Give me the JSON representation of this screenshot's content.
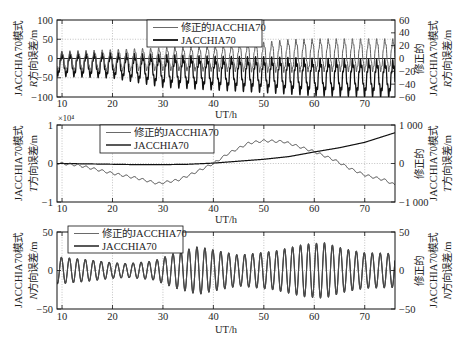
{
  "figure": {
    "panels_count": 3,
    "background": "#ffffff"
  },
  "chart_data": [
    {
      "type": "line",
      "panel": "R",
      "xlabel": "UT/h",
      "xlim": [
        9,
        76
      ],
      "xticks": [
        10,
        20,
        30,
        40,
        50,
        60,
        70
      ],
      "xticklabels": [
        "10",
        "20",
        "30",
        "40",
        "50",
        "60",
        "70"
      ],
      "ylabel_left": {
        "line1": "JACCHIA70模式",
        "var": "R",
        "line2": "方向误差/m"
      },
      "ylabel_right": {
        "line0": "修正的",
        "line1": "JACCHIA70模式",
        "var": "R",
        "line2": "方向误差/m"
      },
      "ylim_left": [
        -100,
        100
      ],
      "yticks_left": [
        -100,
        -50,
        0,
        50,
        100
      ],
      "yticklabels_left": [
        "−100",
        "−50",
        "0",
        "50",
        "100"
      ],
      "ylim_right": [
        -60,
        60
      ],
      "yticks_right": [
        -60,
        -40,
        -20,
        0,
        20,
        40,
        60
      ],
      "yticklabels_right": [
        "−60",
        "−40",
        "−20",
        "0",
        "20",
        "40",
        "60"
      ],
      "grid": true,
      "legend": [
        {
          "label": "修正的JACCHIA70",
          "color": "#6a6a6a",
          "width": 1.0
        },
        {
          "label": "JACCHIA70",
          "color": "#111111",
          "width": 1.8
        }
      ],
      "series": [
        {
          "name": "修正的JACCHIA70",
          "axis": "right",
          "color": "#5e5e5e",
          "width": 1.0,
          "period_h": 1.6,
          "ripple": 0.15,
          "x": [
            9,
            10,
            20,
            30,
            40,
            50,
            55,
            60,
            70,
            76
          ],
          "trend": [
            -4,
            -4,
            -3,
            -1,
            0,
            2,
            4,
            5,
            5,
            5
          ],
          "amplitude": [
            14,
            14,
            15,
            16,
            18,
            21,
            23,
            23,
            23,
            23
          ]
        },
        {
          "name": "JACCHIA70",
          "axis": "left",
          "color": "#111111",
          "width": 1.3,
          "period_h": 1.6,
          "ripple": 0.25,
          "x": [
            9,
            10,
            20,
            30,
            40,
            50,
            60,
            70,
            76
          ],
          "trend": [
            -14,
            -15,
            -18,
            -32,
            -38,
            -42,
            -48,
            -50,
            -52
          ],
          "amplitude": [
            26,
            26,
            27,
            35,
            36,
            38,
            40,
            40,
            40
          ]
        }
      ]
    },
    {
      "type": "line",
      "panel": "T",
      "xlabel": "UT/h",
      "xlim": [
        9,
        76
      ],
      "xticks": [
        10,
        20,
        30,
        40,
        50,
        60,
        70
      ],
      "xticklabels": [
        "10",
        "20",
        "30",
        "40",
        "50",
        "60",
        "70"
      ],
      "y_multiplier": "×10⁴",
      "ylabel_left": {
        "line1": "JACCHIA70模式",
        "var": "T",
        "line2": "方向误差/m"
      },
      "ylabel_right": {
        "line0": "修正的",
        "line1": "JACCHIA70模式",
        "var": "T",
        "line2": "方向误差/m"
      },
      "ylim_left": [
        -1,
        1
      ],
      "yticks_left": [
        -1,
        0,
        1
      ],
      "yticklabels_left": [
        "−1",
        "0",
        "1"
      ],
      "ylim_right": [
        -1000,
        1000
      ],
      "yticks_right": [
        -1000,
        0,
        1000
      ],
      "yticklabels_right": [
        "−1 000",
        "0",
        "1 000"
      ],
      "grid": true,
      "legend": [
        {
          "label": "修正的JACCHIA70",
          "color": "#6a6a6a",
          "width": 1.0
        },
        {
          "label": "JACCHIA70",
          "color": "#111111",
          "width": 1.4
        }
      ],
      "series": [
        {
          "name": "修正的JACCHIA70",
          "axis": "right",
          "color": "#3a3a3a",
          "width": 1.0,
          "period_h": 1.6,
          "ripple": 0,
          "x": [
            9,
            10,
            13,
            16,
            20,
            25,
            29,
            33,
            36,
            40,
            43,
            47,
            50,
            54,
            57,
            60,
            64,
            67,
            70,
            74,
            76
          ],
          "trend": [
            10,
            0,
            -40,
            -130,
            -255,
            -385,
            -520,
            -430,
            -255,
            0,
            265,
            530,
            590,
            566,
            437,
            307,
            90,
            -125,
            -300,
            -430,
            -560
          ],
          "amplitude": 28
        },
        {
          "name": "JACCHIA70",
          "axis": "left",
          "color": "#111111",
          "width": 1.2,
          "x": [
            9,
            10,
            15,
            20,
            25,
            30,
            35,
            40,
            45,
            50,
            55,
            60,
            65,
            70,
            76
          ],
          "trend": [
            0,
            0,
            -0.01,
            -0.02,
            -0.03,
            -0.03,
            -0.02,
            0.01,
            0.06,
            0.11,
            0.18,
            0.3,
            0.41,
            0.55,
            0.8
          ],
          "amplitude": 0
        }
      ]
    },
    {
      "type": "line",
      "panel": "N",
      "xlabel": "UT/h",
      "xlim": [
        9,
        76
      ],
      "xticks": [
        10,
        20,
        30,
        40,
        50,
        60,
        70
      ],
      "xticklabels": [
        "10",
        "20",
        "30",
        "40",
        "50",
        "60",
        "70"
      ],
      "ylabel_left": {
        "line1": "JACCHIA70模式",
        "var": "N",
        "line2": "方向误差/m"
      },
      "ylabel_right": {
        "line0": "修正的",
        "line1": "JACCHIA70模式",
        "var": "N",
        "line2": "方向误差/m"
      },
      "ylim_left": [
        -50,
        50
      ],
      "yticks_left": [
        -50,
        0,
        50
      ],
      "yticklabels_left": [
        "−50",
        "0",
        "50"
      ],
      "ylim_right": [
        -50,
        50
      ],
      "yticks_right": [
        -50,
        0,
        50
      ],
      "yticklabels_right": [
        "−50",
        "0",
        "50"
      ],
      "grid": true,
      "legend": [
        {
          "label": "修正的JACCHIA70",
          "color": "#6a6a6a",
          "width": 1.0
        },
        {
          "label": "JACCHIA70",
          "color": "#111111",
          "width": 1.4
        }
      ],
      "series": [
        {
          "name": "修正的JACCHIA70",
          "axis": "right",
          "color": "#4a4a4a",
          "width": 1.1,
          "period_h": 1.58,
          "ripple": 0,
          "x": [
            9,
            10,
            15,
            20,
            23,
            28,
            33,
            37,
            42,
            45,
            52,
            58,
            62,
            66,
            70,
            76
          ],
          "trend": [
            0,
            0,
            0,
            0,
            0,
            0,
            0,
            0,
            0,
            0,
            0,
            0,
            0,
            0,
            0,
            0
          ],
          "amplitude": [
            17,
            17,
            14,
            10,
            9,
            12,
            24,
            31,
            24,
            20,
            25,
            34,
            36,
            28,
            23,
            22
          ]
        },
        {
          "name": "JACCHIA70",
          "axis": "left",
          "color": "#222222",
          "width": 1.1,
          "period_h": 1.58,
          "ripple": 0,
          "x": [
            9,
            10,
            15,
            20,
            23,
            28,
            33,
            37,
            42,
            45,
            52,
            58,
            62,
            66,
            70,
            76
          ],
          "trend": [
            0,
            0,
            0,
            0,
            0,
            0,
            0,
            0,
            0,
            0,
            0,
            0,
            0,
            0,
            0,
            0
          ],
          "amplitude": [
            17,
            17,
            14,
            10,
            9,
            12,
            24,
            31,
            24,
            20,
            25,
            34,
            36,
            28,
            23,
            22
          ]
        }
      ]
    }
  ]
}
